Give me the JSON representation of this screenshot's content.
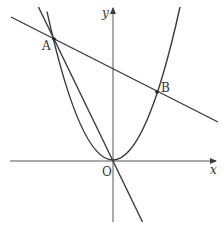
{
  "diagram": {
    "type": "coordinate-geometry",
    "colors": {
      "stroke": "#3a3a3a",
      "background": "#ffffff"
    },
    "axes": {
      "x_label": "x",
      "y_label": "y",
      "origin_label": "O"
    },
    "points": {
      "A": {
        "label": "A"
      },
      "B": {
        "label": "B"
      },
      "O": {
        "label": "O"
      }
    },
    "curves": [
      {
        "name": "parabola",
        "kind": "parabola",
        "vertex": "O"
      },
      {
        "name": "line-AB",
        "kind": "line",
        "through": [
          "A",
          "B"
        ]
      },
      {
        "name": "line-OA",
        "kind": "line",
        "through": [
          "O",
          "A"
        ]
      }
    ]
  }
}
